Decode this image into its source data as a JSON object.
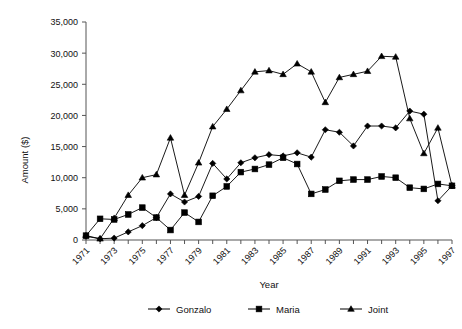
{
  "chart_data": {
    "type": "line",
    "title": "",
    "xlabel": "Year",
    "ylabel": "Amount ($)",
    "x": [
      1971,
      1972,
      1973,
      1974,
      1975,
      1976,
      1977,
      1978,
      1979,
      1980,
      1981,
      1982,
      1983,
      1984,
      1985,
      1986,
      1987,
      1988,
      1989,
      1990,
      1991,
      1992,
      1993,
      1994,
      1995,
      1996,
      1997
    ],
    "xlim": [
      1971,
      1997
    ],
    "ylim": [
      0,
      35000
    ],
    "yticks": [
      0,
      5000,
      10000,
      15000,
      20000,
      25000,
      30000,
      35000
    ],
    "ytick_labels": [
      "0",
      "5,000",
      "10,000",
      "15,000",
      "20,000",
      "25,000",
      "30,000",
      "35,000"
    ],
    "xtick_labels": [
      "1971",
      "1973",
      "1975",
      "1977",
      "1979",
      "1981",
      "1983",
      "1985",
      "1987",
      "1989",
      "1991",
      "1993",
      "1995",
      "1997"
    ],
    "xtick_label_step": 2,
    "grid": false,
    "legend_position": "bottom",
    "series": [
      {
        "name": "Gonzalo",
        "marker": "diamond",
        "color": "#000000",
        "values": [
          600,
          200,
          300,
          1300,
          2300,
          3600,
          7400,
          6100,
          7000,
          12300,
          9800,
          12400,
          13200,
          13700,
          13500,
          14000,
          13300,
          17700,
          17300,
          15100,
          18300,
          18300,
          18000,
          20700,
          20200,
          6300,
          8700
        ]
      },
      {
        "name": "Maria",
        "marker": "square",
        "color": "#000000",
        "values": [
          700,
          3400,
          3300,
          4100,
          5200,
          3600,
          1600,
          4400,
          2900,
          7100,
          8600,
          10900,
          11400,
          12100,
          13200,
          12200,
          7400,
          8100,
          9500,
          9700,
          9700,
          10200,
          10000,
          8400,
          8200,
          9000,
          8700
        ]
      },
      {
        "name": "Joint",
        "marker": "triangle",
        "color": "#000000",
        "values": [
          700,
          200,
          3500,
          7200,
          10000,
          10500,
          16400,
          7200,
          12400,
          18200,
          21000,
          24000,
          27000,
          27200,
          26600,
          28300,
          27000,
          22100,
          26100,
          26600,
          27100,
          29500,
          29400,
          19500,
          13900,
          18000,
          8700
        ]
      }
    ]
  },
  "legend": {
    "items": [
      {
        "label": "Gonzalo",
        "marker": "diamond"
      },
      {
        "label": "Maria",
        "marker": "square"
      },
      {
        "label": "Joint",
        "marker": "triangle"
      }
    ]
  }
}
